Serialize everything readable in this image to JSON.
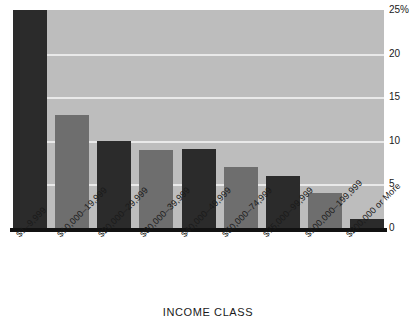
{
  "chart_data": {
    "type": "bar",
    "title": "",
    "subtitle": "",
    "xlabel": "INCOME CLASS",
    "ylabel": "",
    "categories": [
      "$1–9,999",
      "$10,000–19,999",
      "$20,000–29,999",
      "$30,000–39,999",
      "$40,000–49,999",
      "$50,000–74,999",
      "$75,000–99,999",
      "$100,000–199,999",
      "$200,000 or More"
    ],
    "values": [
      25,
      13,
      10,
      9,
      9.1,
      7,
      6,
      4,
      1
    ],
    "ylim": [
      0,
      25
    ],
    "ytick_labels": [
      "25%",
      "20",
      "15",
      "10",
      "5",
      "0"
    ],
    "ytick_values": [
      25,
      20,
      15,
      10,
      5,
      0
    ],
    "grid": true,
    "grid_axis": "y",
    "legend": "none",
    "bar_colors": [
      "#2b2b2b",
      "#6e6e6e",
      "#2b2b2b",
      "#6e6e6e",
      "#2b2b2b",
      "#6e6e6e",
      "#2b2b2b",
      "#6e6e6e",
      "#2b2b2b"
    ],
    "plot_background": "#bdbdbd",
    "gridline_color": "#e9e9e9",
    "axis_color": "#111111",
    "value_unit": "%"
  }
}
